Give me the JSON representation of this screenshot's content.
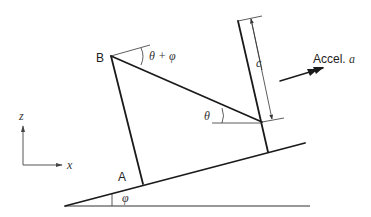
{
  "diagram": {
    "labels": {
      "point_b": "B",
      "point_a": "A",
      "angle_theta_phi": "θ + φ",
      "angle_theta": "θ",
      "angle_phi": "φ",
      "length_c": "c",
      "accel": "Accel. ",
      "accel_symbol": "a",
      "axis_z": "z",
      "axis_x": "x"
    },
    "colors": {
      "line": "#1a1a1a",
      "background": "#ffffff"
    }
  }
}
